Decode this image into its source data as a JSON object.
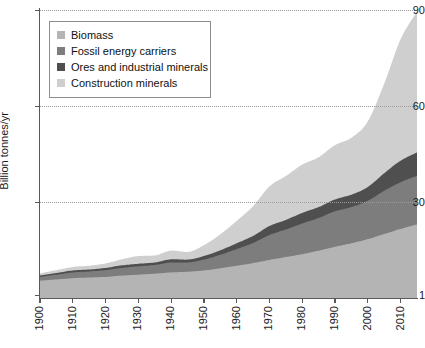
{
  "chart_data": {
    "type": "area",
    "stacked": true,
    "title": "",
    "xlabel": "",
    "ylabel": "Billion tonnes/yr",
    "xlim": [
      1900,
      2015
    ],
    "ylim": [
      0,
      90
    ],
    "grid": true,
    "legend_position": "top-left",
    "y_ticks": [
      "1",
      "30",
      "60",
      "90"
    ],
    "y_tick_values": [
      0,
      30,
      60,
      90
    ],
    "x_ticks": [
      "1900",
      "1910",
      "1920",
      "1930",
      "1940",
      "1950",
      "1960",
      "1970",
      "1980",
      "1990",
      "2000",
      "2010"
    ],
    "x_tick_values": [
      1900,
      1910,
      1920,
      1930,
      1940,
      1950,
      1960,
      1970,
      1980,
      1990,
      2000,
      2010
    ],
    "x": [
      1900,
      1905,
      1910,
      1915,
      1920,
      1925,
      1930,
      1935,
      1940,
      1945,
      1950,
      1955,
      1960,
      1965,
      1970,
      1975,
      1980,
      1985,
      1990,
      1995,
      2000,
      2005,
      2010,
      2015
    ],
    "series": [
      {
        "name": "Biomass",
        "color": "#b4b4b4",
        "values": [
          5.4,
          5.8,
          6.2,
          6.4,
          6.6,
          7.0,
          7.3,
          7.6,
          8.0,
          8.2,
          8.6,
          9.3,
          10.1,
          10.9,
          11.9,
          12.8,
          13.7,
          14.8,
          16.0,
          17.1,
          18.4,
          20.0,
          21.6,
          23.0
        ]
      },
      {
        "name": "Fossil energy carriers",
        "color": "#7d7d7d",
        "values": [
          1.2,
          1.5,
          1.8,
          1.9,
          2.1,
          2.4,
          2.6,
          2.7,
          3.1,
          2.9,
          3.4,
          4.2,
          5.2,
          6.3,
          7.8,
          8.6,
          9.6,
          10.2,
          11.1,
          11.3,
          12.0,
          13.5,
          14.6,
          15.2
        ]
      },
      {
        "name": "Ores and industrial minerals",
        "color": "#4f4f4f",
        "values": [
          0.4,
          0.5,
          0.6,
          0.6,
          0.7,
          0.8,
          0.8,
          0.8,
          1.0,
          0.9,
          1.1,
          1.4,
          1.8,
          2.2,
          2.8,
          3.0,
          3.3,
          3.4,
          3.7,
          3.9,
          4.3,
          5.5,
          6.7,
          7.3
        ]
      },
      {
        "name": "Construction minerals",
        "color": "#cfcfcf",
        "values": [
          0.7,
          0.9,
          1.1,
          1.2,
          1.4,
          1.9,
          2.4,
          2.2,
          2.7,
          2.4,
          3.4,
          5.0,
          7.0,
          9.3,
          12.4,
          13.7,
          15.1,
          15.6,
          17.0,
          17.8,
          20.5,
          28.0,
          38.0,
          44.0
        ]
      }
    ],
    "totals": [
      7.7,
      8.7,
      9.7,
      10.1,
      10.8,
      12.1,
      13.1,
      13.3,
      14.8,
      14.4,
      16.5,
      19.9,
      24.1,
      28.7,
      34.9,
      38.1,
      41.7,
      44.0,
      47.8,
      50.1,
      55.2,
      67.0,
      80.9,
      89.5
    ]
  },
  "legend": {
    "items": [
      {
        "label": "Biomass",
        "color": "#b4b4b4"
      },
      {
        "label": "Fossil energy carriers",
        "color": "#7d7d7d"
      },
      {
        "label": "Ores and industrial minerals",
        "color": "#4f4f4f"
      },
      {
        "label": "Construction minerals",
        "color": "#cfcfcf"
      }
    ]
  },
  "axes": {
    "y_title": "Billion tonnes/yr",
    "y_labels": [
      "90",
      "60",
      "30",
      "1"
    ],
    "x_labels": [
      "1900",
      "1910",
      "1920",
      "1930",
      "1940",
      "1950",
      "1960",
      "1970",
      "1980",
      "1990",
      "2000",
      "2010"
    ]
  },
  "colors": {
    "axis": "#595959",
    "grid": "#9a9a9a",
    "text": "#1a1a1a",
    "legend_border": "#8c8c8c",
    "background": "#ffffff"
  }
}
